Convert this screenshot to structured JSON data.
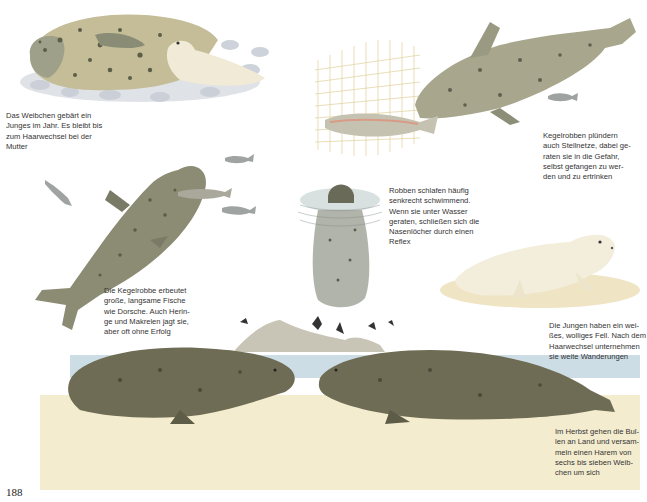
{
  "page": {
    "number": "188",
    "colors": {
      "paper": "#ffffff",
      "seal_body": "#b7b08f",
      "seal_dark": "#5f6250",
      "pup_white": "#f1ecd9",
      "water": "#a9c3d3",
      "sand": "#e6d7a6",
      "net": "#d8c37a"
    }
  },
  "captions": {
    "mother_pup": "Das Weibchen gebärt ein\nJunges im Jahr. Es bleibt bis\nzum Haarwechsel bei der\nMutter",
    "net": "Kegelrobben plündern\nauch Stellnetze, dabei ge-\nraten sie in die Gefahr,\nselbst gefangen zu wer-\nden und zu ertrinken",
    "sleeping": "Robben schlafen häufig\nsenkrecht schwimmend.\nWenn sie unter Wasser\ngeraten, schließen sich die\nNasenlöcher durch einen\nReflex",
    "hunting": "Die Kegelrobbe erbeutet\ngroße, langsame Fische\nwie Dorsche. Auch Herin-\nge und Makrelen jagt sie,\naber oft ohne Erfolg",
    "pup_fur": "Die Jungen haben ein wei-\nßes, wolliges Fell. Nach dem\nHaarwechsel unternehmen\nsie weite Wanderungen",
    "bulls": "Im Herbst gehen die Bul-\nlen an Land und versam-\nmeln einen Harem von\nsechs bis sieben Weib-\nchen um sich"
  },
  "illustrations": [
    {
      "id": "mother-with-pup",
      "subject": "Seal mother lying on pebbles with white pup"
    },
    {
      "id": "seal-raiding-net",
      "subject": "Grey seal swimming near fishing net with salmon"
    },
    {
      "id": "seal-hunting-fish",
      "subject": "Grey seal swimming vertically chasing small fish"
    },
    {
      "id": "sleeping-seal",
      "subject": "Seal sleeping vertically in water, head above surface"
    },
    {
      "id": "white-pup",
      "subject": "White woolly seal pup on sand"
    },
    {
      "id": "bulls-on-beach",
      "subject": "Two grey seal bulls facing each other on beach, island with cormorants behind"
    }
  ]
}
